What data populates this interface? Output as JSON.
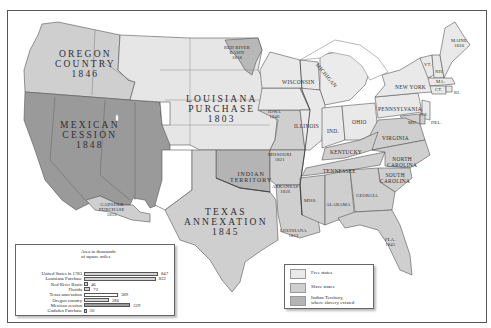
{
  "colors": {
    "free": "#e9e9e9",
    "slave": "#cfcfcf",
    "territory_dark": "#9a9a9a",
    "indian_territory": "#b4b4b4",
    "border": "#555555",
    "water": "#ffffff",
    "us1783_bar": "#d4d4d4"
  },
  "regions": {
    "oregon": {
      "name1": "OREGON",
      "name2": "COUNTRY",
      "year": "1846"
    },
    "mexican": {
      "name1": "MEXICAN",
      "name2": "CESSION",
      "year": "1848"
    },
    "louisiana": {
      "name1": "LOUISIANA",
      "name2": "PURCHASE",
      "year": "1803"
    },
    "texas": {
      "name1": "TEXAS",
      "name2": "ANNEXATION",
      "year": "1845"
    },
    "red_river": {
      "name1": "RED RIVER",
      "name2": "BASIN",
      "year": "1818"
    },
    "gadsden": {
      "name1": "GADSDEN",
      "name2": "PURCHASE",
      "year": "1853"
    },
    "indian_territory": {
      "name1": "INDIAN",
      "name2": "TERRITORY"
    }
  },
  "states": {
    "maine": {
      "name": "MAINE",
      "year": "1820"
    },
    "vt": "VT.",
    "nh": "NH.",
    "ma": "MA.",
    "ct": "CT.",
    "ri": "RI.",
    "ny": "NEW YORK",
    "pa": "PENNSYLVANIA",
    "nj": "N.J.",
    "md": "MD.",
    "del": "DEL.",
    "michigan": "MICHIGAN",
    "wisconsin": "WISCONSIN",
    "iowa": {
      "name": "IOWA",
      "year": "1846"
    },
    "illinois": "ILLINOIS",
    "ind": "IND.",
    "ohio": "OHIO",
    "virginia": "VIRGINIA",
    "kentucky": "KENTUCKY",
    "missouri": {
      "name": "MISSOURI",
      "year": "1821"
    },
    "nc": {
      "name1": "NORTH",
      "name2": "CAROLINA"
    },
    "tennessee": "TENNESSEE",
    "sc": {
      "name1": "SOUTH",
      "name2": "CAROLINA"
    },
    "arkansas": {
      "name": "ARKANSAS",
      "year": "1836"
    },
    "miss": "MISS.",
    "alabama": "ALABAMA",
    "georgia": "GEORGIA",
    "louisiana": {
      "name": "LOUISIANA",
      "year": "1812"
    },
    "fla": {
      "name": "FLA.",
      "year": "1845"
    }
  },
  "legend": {
    "items": [
      {
        "label": "Free states",
        "color": "#e9e9e9"
      },
      {
        "label": "Slave states",
        "color": "#cfcfcf"
      },
      {
        "label": "Indian Territory,",
        "label2": "where slavery existed",
        "color": "#b4b4b4"
      }
    ]
  },
  "chart_data": {
    "type": "bar",
    "title": "Area in thousands of square miles",
    "title_line1": "Area in thousands",
    "title_line2": "of square miles",
    "categories": [
      "United States in 1783",
      "Louisiana Purchase",
      "Red River Basin",
      "Florida",
      "Texas annexation",
      "Oregon country",
      "Mexican cession",
      "Gadsden Purchase"
    ],
    "values": [
      847,
      822,
      46,
      72,
      389,
      286,
      529,
      30
    ],
    "value_labels": [
      "847",
      "822",
      "46",
      "72",
      "389",
      "286",
      "529",
      "30"
    ],
    "xlabel": "",
    "ylabel": "",
    "orientation": "horizontal",
    "grid": false
  }
}
